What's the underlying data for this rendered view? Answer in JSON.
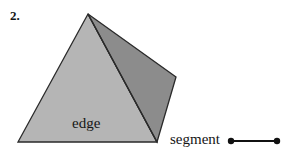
{
  "figure": {
    "item_number": "2.",
    "labels": {
      "edge": "edge",
      "segment": "segment"
    },
    "colors": {
      "background": "#ffffff",
      "front_face_fill": "#b5b5b5",
      "right_face_fill": "#8c8c8c",
      "outline": "#2a2a2a",
      "text": "#151515",
      "segment_stroke": "#111111"
    },
    "shape": {
      "name": "pyramid",
      "apex": "88,14",
      "bottom_left": "18,142",
      "bottom_right": "157,142",
      "right_vertex": "176,77",
      "front_face_points": "88,14 18,142 157,142",
      "right_face_points": "88,14 157,142 176,77"
    },
    "segment_glyph": {
      "x1": 231,
      "y1": 141,
      "x2": 277,
      "y2": 141,
      "endpoint_radius": 3.2,
      "line_width": 2.2
    }
  }
}
